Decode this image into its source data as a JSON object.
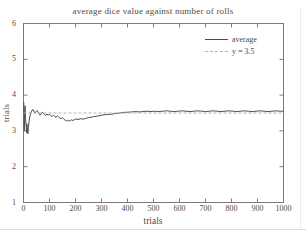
{
  "colors": {
    "text": "#4f4b45",
    "axis": "#7a7a7a",
    "series_line": "#4d4d4d",
    "reference_line": "#b3b3b3",
    "background": "#ffffff"
  },
  "chart_data": {
    "type": "line",
    "title": "average dice value against number of rolls",
    "xlabel": "trials",
    "ylabel": "trials",
    "xlim": [
      0,
      1000
    ],
    "ylim": [
      1,
      6
    ],
    "x_ticks": [
      0,
      100,
      200,
      300,
      400,
      500,
      600,
      700,
      800,
      900,
      1000
    ],
    "y_ticks": [
      1,
      2,
      3,
      4,
      5,
      6
    ],
    "grid": false,
    "legend": {
      "position": "top-right",
      "entries": [
        {
          "label": "average",
          "style": "solid",
          "color": "#4d4d4d"
        },
        {
          "label": "y = 3.5",
          "style": "dashed",
          "color": "#b3b3b3"
        }
      ]
    },
    "series": [
      {
        "name": "average",
        "style": "solid",
        "color": "#4d4d4d",
        "points": [
          [
            1,
            3.8
          ],
          [
            2,
            3.5
          ],
          [
            3,
            3.0
          ],
          [
            4,
            3.3
          ],
          [
            5,
            3.55
          ],
          [
            6,
            3.7
          ],
          [
            7,
            3.5
          ],
          [
            8,
            3.35
          ],
          [
            10,
            3.15
          ],
          [
            12,
            2.95
          ],
          [
            13,
            3.2
          ],
          [
            15,
            3.05
          ],
          [
            17,
            2.92
          ],
          [
            19,
            3.1
          ],
          [
            22,
            3.3
          ],
          [
            25,
            3.42
          ],
          [
            28,
            3.5
          ],
          [
            32,
            3.56
          ],
          [
            36,
            3.6
          ],
          [
            40,
            3.55
          ],
          [
            44,
            3.5
          ],
          [
            48,
            3.54
          ],
          [
            52,
            3.57
          ],
          [
            56,
            3.52
          ],
          [
            60,
            3.48
          ],
          [
            64,
            3.44
          ],
          [
            68,
            3.48
          ],
          [
            72,
            3.52
          ],
          [
            76,
            3.5
          ],
          [
            80,
            3.46
          ],
          [
            85,
            3.43
          ],
          [
            90,
            3.47
          ],
          [
            95,
            3.44
          ],
          [
            100,
            3.46
          ],
          [
            105,
            3.43
          ],
          [
            110,
            3.4
          ],
          [
            115,
            3.44
          ],
          [
            120,
            3.41
          ],
          [
            125,
            3.38
          ],
          [
            130,
            3.42
          ],
          [
            135,
            3.39
          ],
          [
            140,
            3.36
          ],
          [
            145,
            3.34
          ],
          [
            150,
            3.37
          ],
          [
            155,
            3.33
          ],
          [
            160,
            3.3
          ],
          [
            165,
            3.28
          ],
          [
            170,
            3.3
          ],
          [
            175,
            3.27
          ],
          [
            180,
            3.29
          ],
          [
            185,
            3.31
          ],
          [
            190,
            3.29
          ],
          [
            195,
            3.31
          ],
          [
            200,
            3.33
          ],
          [
            210,
            3.32
          ],
          [
            220,
            3.34
          ],
          [
            230,
            3.33
          ],
          [
            240,
            3.35
          ],
          [
            250,
            3.37
          ],
          [
            260,
            3.38
          ],
          [
            270,
            3.4
          ],
          [
            280,
            3.41
          ],
          [
            290,
            3.42
          ],
          [
            300,
            3.44
          ],
          [
            310,
            3.45
          ],
          [
            320,
            3.46
          ],
          [
            330,
            3.46
          ],
          [
            340,
            3.47
          ],
          [
            350,
            3.48
          ],
          [
            360,
            3.49
          ],
          [
            370,
            3.5
          ],
          [
            380,
            3.51
          ],
          [
            390,
            3.52
          ],
          [
            400,
            3.52
          ],
          [
            415,
            3.53
          ],
          [
            430,
            3.54
          ],
          [
            445,
            3.53
          ],
          [
            460,
            3.54
          ],
          [
            475,
            3.55
          ],
          [
            490,
            3.54
          ],
          [
            505,
            3.55
          ],
          [
            520,
            3.54
          ],
          [
            535,
            3.55
          ],
          [
            550,
            3.56
          ],
          [
            565,
            3.55
          ],
          [
            580,
            3.54
          ],
          [
            595,
            3.55
          ],
          [
            610,
            3.56
          ],
          [
            625,
            3.55
          ],
          [
            640,
            3.54
          ],
          [
            655,
            3.55
          ],
          [
            670,
            3.56
          ],
          [
            685,
            3.55
          ],
          [
            700,
            3.54
          ],
          [
            715,
            3.55
          ],
          [
            730,
            3.56
          ],
          [
            745,
            3.55
          ],
          [
            760,
            3.54
          ],
          [
            775,
            3.55
          ],
          [
            790,
            3.56
          ],
          [
            805,
            3.55
          ],
          [
            820,
            3.54
          ],
          [
            835,
            3.55
          ],
          [
            850,
            3.56
          ],
          [
            865,
            3.55
          ],
          [
            880,
            3.54
          ],
          [
            895,
            3.55
          ],
          [
            910,
            3.56
          ],
          [
            925,
            3.55
          ],
          [
            940,
            3.54
          ],
          [
            955,
            3.55
          ],
          [
            970,
            3.56
          ],
          [
            985,
            3.55
          ],
          [
            1000,
            3.55
          ]
        ]
      },
      {
        "name": "y = 3.5",
        "style": "dashed",
        "color": "#b3b3b3",
        "points": [
          [
            0,
            3.5
          ],
          [
            1000,
            3.5
          ]
        ]
      }
    ]
  }
}
